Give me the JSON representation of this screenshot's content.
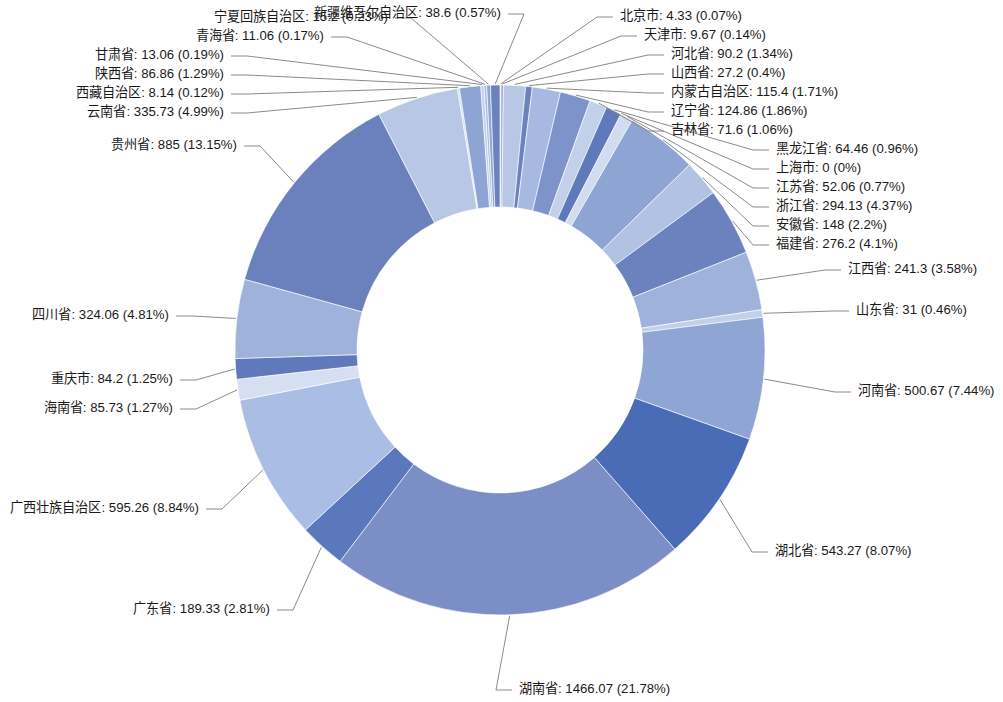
{
  "chart_data": {
    "type": "pie",
    "variant": "donut",
    "title": "",
    "subtitle": "",
    "xlabel": "",
    "ylabel": "",
    "legend": "none",
    "grid": false,
    "label_format": "{name}: {value} ({percent})",
    "start_angle_deg": 0,
    "direction": "clockwise",
    "total": 6730.07,
    "center": {
      "x": 500,
      "y": 350
    },
    "inner_radius": 143,
    "outer_radius": 265,
    "categories": [
      "北京市",
      "天津市",
      "河北省",
      "山西省",
      "内蒙古自治区",
      "辽宁省",
      "吉林省",
      "黑龙江省",
      "上海市",
      "江苏省",
      "浙江省",
      "安徽省",
      "福建省",
      "江西省",
      "山东省",
      "河南省",
      "湖北省",
      "湖南省",
      "广东省",
      "广西壮族自治区",
      "海南省",
      "重庆市",
      "四川省",
      "贵州省",
      "云南省",
      "西藏自治区",
      "陕西省",
      "甘肃省",
      "青海省",
      "宁夏回族自治区",
      "新疆维吾尔自治区"
    ],
    "values": [
      4.33,
      9.67,
      90.2,
      27.2,
      115.4,
      124.86,
      71.6,
      64.46,
      0,
      52.06,
      294.13,
      148,
      276.2,
      241.3,
      31,
      500.67,
      543.27,
      1466.07,
      189.33,
      595.26,
      85.73,
      84.2,
      324.06,
      885,
      335.73,
      8.14,
      86.86,
      13.06,
      11.06,
      15.2,
      38.6
    ],
    "percents": [
      "0.07%",
      "0.14%",
      "1.34%",
      "0.4%",
      "1.71%",
      "1.86%",
      "1.06%",
      "0.96%",
      "0%",
      "0.77%",
      "4.37%",
      "2.2%",
      "4.1%",
      "3.58%",
      "0.46%",
      "7.44%",
      "8.07%",
      "21.78%",
      "2.81%",
      "8.84%",
      "1.27%",
      "1.25%",
      "4.81%",
      "13.15%",
      "4.99%",
      "0.12%",
      "1.29%",
      "0.19%",
      "0.23%",
      "0.57%"
    ],
    "colors": [
      "#c8d4ec",
      "#8ea4d2",
      "#b9c7e6",
      "#6c82be",
      "#a7b9e0",
      "#7e93c9",
      "#c3d0ea",
      "#5f79ba",
      "#9fb2dc",
      "#d2dcf0",
      "#8ea4d2",
      "#b2c2e3",
      "#6c82be",
      "#9fb2dc",
      "#c3d0ea",
      "#8fa5d4",
      "#4a6bb5",
      "#7b8fc6",
      "#5b78bd",
      "#aabde4",
      "#d6dff2",
      "#5f79ba",
      "#9fb2dc",
      "#6b81bd",
      "#b9c7e6",
      "#d2dcf0",
      "#8ea4d2",
      "#c3d0ea",
      "#aabde4",
      "#8fa5d4",
      "#6c82be"
    ],
    "labels": [
      {
        "name": "北京市",
        "text": "北京市: 4.33 (0.07%)",
        "side": "right",
        "x": 613,
        "y": 17,
        "tx": 620,
        "ty": 17
      },
      {
        "name": "天津市",
        "text": "天津市: 9.67 (0.14%)",
        "side": "right",
        "x": 637,
        "y": 36,
        "tx": 644,
        "ty": 36
      },
      {
        "name": "河北省",
        "text": "河北省: 90.2 (1.34%)",
        "side": "right",
        "x": 664,
        "y": 55,
        "tx": 671,
        "ty": 55
      },
      {
        "name": "山西省",
        "text": "山西省: 27.2 (0.4%)",
        "side": "right",
        "x": 664,
        "y": 74,
        "tx": 671,
        "ty": 74
      },
      {
        "name": "内蒙古自治区",
        "text": "内蒙古自治区: 115.4 (1.71%)",
        "side": "right",
        "x": 664,
        "y": 93,
        "tx": 671,
        "ty": 93
      },
      {
        "name": "辽宁省",
        "text": "辽宁省: 124.86 (1.86%)",
        "side": "right",
        "x": 664,
        "y": 112,
        "tx": 671,
        "ty": 112
      },
      {
        "name": "吉林省",
        "text": "吉林省: 71.6 (1.06%)",
        "side": "right",
        "x": 664,
        "y": 131,
        "tx": 671,
        "ty": 131
      },
      {
        "name": "黑龙江省",
        "text": "黑龙江省: 64.46 (0.96%)",
        "side": "right",
        "x": 769,
        "y": 150,
        "tx": 776,
        "ty": 150
      },
      {
        "name": "上海市",
        "text": "上海市: 0 (0%)",
        "side": "right",
        "x": 769,
        "y": 169,
        "tx": 776,
        "ty": 169
      },
      {
        "name": "江苏省",
        "text": "江苏省: 52.06 (0.77%)",
        "side": "right",
        "x": 769,
        "y": 188,
        "tx": 776,
        "ty": 188
      },
      {
        "name": "浙江省",
        "text": "浙江省: 294.13 (4.37%)",
        "side": "right",
        "x": 769,
        "y": 207,
        "tx": 776,
        "ty": 207
      },
      {
        "name": "安徽省",
        "text": "安徽省: 148 (2.2%)",
        "side": "right",
        "x": 769,
        "y": 226,
        "tx": 776,
        "ty": 226
      },
      {
        "name": "福建省",
        "text": "福建省: 276.2 (4.1%)",
        "side": "right",
        "x": 769,
        "y": 245,
        "tx": 776,
        "ty": 245
      },
      {
        "name": "江西省",
        "text": "江西省: 241.3 (3.58%)",
        "side": "right",
        "x": 841,
        "y": 270,
        "tx": 848,
        "ty": 270
      },
      {
        "name": "山东省",
        "text": "山东省: 31 (0.46%)",
        "side": "right",
        "x": 849,
        "y": 311,
        "tx": 856,
        "ty": 311
      },
      {
        "name": "河南省",
        "text": "河南省: 500.67 (7.44%)",
        "side": "right",
        "x": 851,
        "y": 392,
        "tx": 858,
        "ty": 392
      },
      {
        "name": "湖北省",
        "text": "湖北省: 543.27 (8.07%)",
        "side": "right",
        "x": 768,
        "y": 552,
        "tx": 775,
        "ty": 552
      },
      {
        "name": "湖南省",
        "text": "湖南省: 1466.07 (21.78%)",
        "side": "right",
        "x": 512,
        "y": 690,
        "tx": 519,
        "ty": 690
      },
      {
        "name": "广东省",
        "text": "广东省: 189.33 (2.81%)",
        "side": "left",
        "x": 277,
        "y": 610,
        "tx": 270,
        "ty": 610
      },
      {
        "name": "广西壮族自治区",
        "text": "广西壮族自治区: 595.26 (8.84%)",
        "side": "left",
        "x": 206,
        "y": 509,
        "tx": 199,
        "ty": 509
      },
      {
        "name": "海南省",
        "text": "海南省: 85.73 (1.27%)",
        "side": "left",
        "x": 180,
        "y": 409,
        "tx": 173,
        "ty": 409
      },
      {
        "name": "重庆市",
        "text": "重庆市: 84.2 (1.25%)",
        "side": "left",
        "x": 180,
        "y": 380,
        "tx": 173,
        "ty": 380
      },
      {
        "name": "四川省",
        "text": "四川省: 324.06 (4.81%)",
        "side": "left",
        "x": 176,
        "y": 316,
        "tx": 169,
        "ty": 316
      },
      {
        "name": "贵州省",
        "text": "贵州省: 885 (13.15%)",
        "side": "left",
        "x": 244,
        "y": 146,
        "tx": 237,
        "ty": 146
      },
      {
        "name": "云南省",
        "text": "云南省: 335.73 (4.99%)",
        "side": "left",
        "x": 231,
        "y": 113,
        "tx": 224,
        "ty": 113
      },
      {
        "name": "西藏自治区",
        "text": "西藏自治区: 8.14 (0.12%)",
        "side": "left",
        "x": 231,
        "y": 94,
        "tx": 224,
        "ty": 94
      },
      {
        "name": "陕西省",
        "text": "陕西省: 86.86 (1.29%)",
        "side": "left",
        "x": 231,
        "y": 75,
        "tx": 224,
        "ty": 75
      },
      {
        "name": "甘肃省",
        "text": "甘肃省: 13.06 (0.19%)",
        "side": "left",
        "x": 231,
        "y": 56,
        "tx": 224,
        "ty": 56
      },
      {
        "name": "青海省",
        "text": "青海省: 11.06 (0.17%)",
        "side": "left",
        "x": 331,
        "y": 37,
        "tx": 324,
        "ty": 37
      },
      {
        "name": "宁夏回族自治区",
        "text": "宁夏回族自治区: 15.2 (0.23%)",
        "side": "left",
        "x": 395,
        "y": 18,
        "tx": 388,
        "ty": 18
      },
      {
        "name": "新疆维吾尔自治区",
        "text": "新疆维吾尔自治区: 38.6 (0.57%)",
        "side": "left",
        "x": 508,
        "y": 14,
        "tx": 501,
        "ty": 14
      }
    ]
  }
}
